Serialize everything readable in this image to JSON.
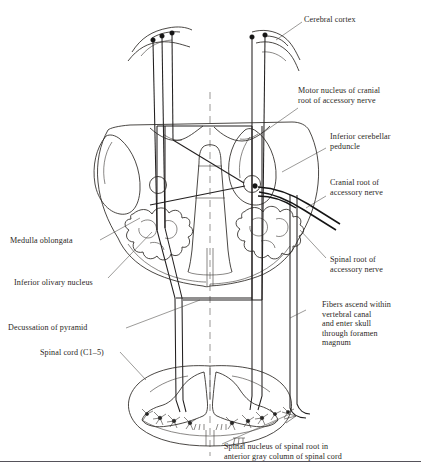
{
  "figure": {
    "title_text": "",
    "type": "anatomical-line-diagram",
    "ink_color": "#2a2724",
    "background_color": "#ffffff",
    "text_color": "#2a2724"
  },
  "labels": {
    "cerebral_cortex": "Cerebral cortex",
    "motor_nucleus": "Motor nucleus of cranial\nroot of accessory nerve",
    "inferior_cerebellar_peduncle": "Inferior cerebellar\npeduncle",
    "cranial_root": "Cranial root of\naccessory nerve",
    "medulla_oblongata": "Medulla oblongata",
    "inferior_olivary_nucleus": "Inferior olivary nucleus",
    "spinal_root": "Spinal root of\naccessory nerve",
    "decussation_of_pyramid": "Decussation of pyramid",
    "fibers_ascend": "Fibers ascend within\nvertebral canal\nand enter skull\nthrough foramen\nmagnum",
    "spinal_cord": "Spinal cord (C1–5)",
    "spinal_nucleus_caption": "Spinal nucleus of spinal root in\nanterior gray column of spinal cord"
  },
  "structures": {
    "cortical_neurons_left_count": 3,
    "cortical_neurons_right_count": 2,
    "olivary_nuclei_count": 2,
    "motor_nucleus_marker": "circle-with-dot",
    "spinal_cord_neurons_left_count": 4,
    "spinal_cord_neurons_right_count": 5,
    "midline": "dashed-vertical"
  }
}
